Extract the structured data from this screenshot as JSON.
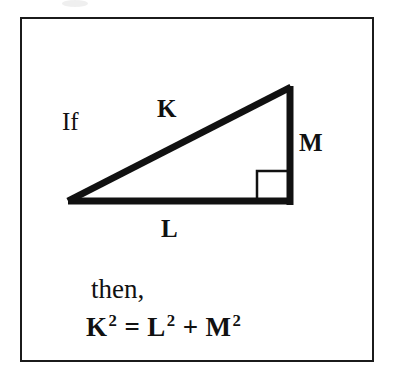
{
  "figure": {
    "frame": {
      "border_color": "#1b1b1b",
      "background": "#ffffff",
      "x": 20,
      "y": 17,
      "width": 354,
      "height": 345
    },
    "stroke_color": "#111111",
    "triangle": {
      "shape": "right-triangle",
      "vertices": {
        "left": [
          68,
          202
        ],
        "bottom_right": [
          291,
          202
        ],
        "top_right": [
          291,
          86
        ]
      },
      "base_label": "L",
      "height_label": "M",
      "hypotenuse_label": "K",
      "right_angle_marker": {
        "x": 257,
        "y": 170,
        "size": 21,
        "present": true
      }
    },
    "labels": {
      "if": "If",
      "hypotenuse": "K",
      "vertical": "M",
      "base": "L",
      "then": "then,"
    },
    "equation": {
      "lhs_base": "K",
      "lhs_exp": "2",
      "equals": "=",
      "t1_base": "L",
      "t1_exp": "2",
      "plus": "+",
      "t2_base": "M",
      "t2_exp": "2",
      "plain_text": "K² = L² + M²"
    }
  }
}
